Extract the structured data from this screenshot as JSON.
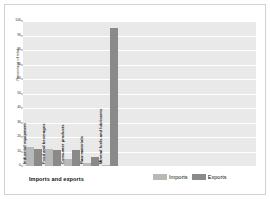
{
  "chart_data": {
    "type": "bar",
    "title": "",
    "xlabel": "Imports and exports",
    "ylabel": "Percentage of total",
    "ylim": [
      0,
      100
    ],
    "yticks": [
      0,
      10,
      20,
      30,
      40,
      50,
      60,
      70,
      80,
      90,
      100
    ],
    "ytick_labels": [
      "0",
      "10",
      "20",
      "30",
      "40",
      "50",
      "60",
      "70",
      "80",
      "90",
      "100"
    ],
    "grid": true,
    "legend_position": "bottom-right",
    "categories": [
      "Industrial equipment",
      "Food and beverages",
      "Consumer products",
      "Raw materials",
      "Mineral fuels and lubricants"
    ],
    "series": [
      {
        "name": "Imports",
        "color": "#b9b9b9",
        "values": [
          13,
          12,
          5,
          2,
          1
        ]
      },
      {
        "name": "Exports",
        "color": "#8a8a8a",
        "values": [
          12,
          11,
          11,
          6,
          95
        ]
      }
    ]
  },
  "legend": {
    "entries": [
      {
        "label": "Imports",
        "color": "#b9b9b9"
      },
      {
        "label": "Exports",
        "color": "#8a8a8a"
      }
    ]
  },
  "colors": {
    "plot_background": "#e9e9e9",
    "gridline": "#ffffff",
    "page_background": "#ffffff",
    "frame": "#d2d2d2",
    "imports": "#b9b9b9",
    "exports": "#8a8a8a"
  }
}
